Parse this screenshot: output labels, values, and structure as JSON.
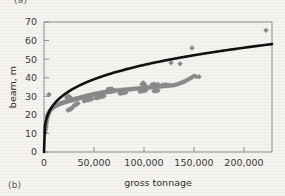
{
  "figure": {
    "panel_a_label": "(a)",
    "panel_b_label": "(b)"
  },
  "chart_data": {
    "type": "scatter",
    "title": "",
    "xlabel": "gross tonnage",
    "ylabel": "beam, m",
    "xlim": [
      0,
      228000
    ],
    "ylim": [
      0,
      70
    ],
    "grid": false,
    "legend": null,
    "xticks": [
      0,
      50000,
      100000,
      150000,
      200000
    ],
    "xticklabels": [
      "0",
      "50,000",
      "100,000",
      "150,000",
      "200,000"
    ],
    "yticks": [
      0,
      10,
      20,
      30,
      40,
      50,
      60,
      70
    ],
    "yticklabels": [
      "0",
      "10",
      "20",
      "30",
      "40",
      "50",
      "60",
      "70"
    ],
    "marker_shape": "diamond",
    "marker_color": "#8a8a8a",
    "curve_color": "#111111",
    "curve_label": "power-law fit",
    "curve_formula": "beam = 2.35 * tonnage^0.26",
    "points": [
      [
        1200,
        10.5
      ],
      [
        1500,
        12.0
      ],
      [
        1700,
        13.2
      ],
      [
        1900,
        14.0
      ],
      [
        2100,
        15.1
      ],
      [
        2300,
        16.0
      ],
      [
        2600,
        17.0
      ],
      [
        2900,
        17.8
      ],
      [
        3200,
        18.6
      ],
      [
        3600,
        19.2
      ],
      [
        4000,
        19.9
      ],
      [
        4400,
        20.4
      ],
      [
        4800,
        21.0
      ],
      [
        5200,
        21.5
      ],
      [
        5600,
        22.0
      ],
      [
        5000,
        31.0
      ],
      [
        6200,
        22.4
      ],
      [
        6800,
        22.8
      ],
      [
        7400,
        23.1
      ],
      [
        8000,
        23.5
      ],
      [
        8600,
        23.8
      ],
      [
        9200,
        24.0
      ],
      [
        9900,
        24.3
      ],
      [
        10600,
        24.6
      ],
      [
        11300,
        24.8
      ],
      [
        12000,
        25.0
      ],
      [
        12800,
        25.2
      ],
      [
        13600,
        25.4
      ],
      [
        14400,
        25.6
      ],
      [
        15200,
        25.8
      ],
      [
        16000,
        26.0
      ],
      [
        17000,
        26.2
      ],
      [
        18000,
        26.4
      ],
      [
        19000,
        26.5
      ],
      [
        20000,
        26.7
      ],
      [
        21000,
        26.9
      ],
      [
        22000,
        27.0
      ],
      [
        23000,
        27.2
      ],
      [
        24000,
        27.4
      ],
      [
        25000,
        27.6
      ],
      [
        26000,
        27.7
      ],
      [
        22500,
        29.5
      ],
      [
        23500,
        29.8
      ],
      [
        24500,
        30.0
      ],
      [
        25500,
        29.6
      ],
      [
        26500,
        29.2
      ],
      [
        24000,
        22.5
      ],
      [
        25000,
        22.8
      ],
      [
        26000,
        23.0
      ],
      [
        27000,
        23.3
      ],
      [
        28000,
        23.6
      ],
      [
        27500,
        27.9
      ],
      [
        28500,
        28.0
      ],
      [
        29500,
        28.2
      ],
      [
        30500,
        28.4
      ],
      [
        31500,
        28.5
      ],
      [
        32500,
        28.7
      ],
      [
        33500,
        28.8
      ],
      [
        34500,
        29.0
      ],
      [
        35500,
        29.1
      ],
      [
        36500,
        29.3
      ],
      [
        30000,
        25.0
      ],
      [
        31000,
        25.3
      ],
      [
        32000,
        25.6
      ],
      [
        33000,
        25.9
      ],
      [
        34000,
        26.2
      ],
      [
        37500,
        29.4
      ],
      [
        38500,
        29.6
      ],
      [
        39500,
        29.7
      ],
      [
        40500,
        29.8
      ],
      [
        41500,
        30.0
      ],
      [
        42500,
        30.1
      ],
      [
        43500,
        30.2
      ],
      [
        44500,
        30.4
      ],
      [
        45500,
        30.5
      ],
      [
        46500,
        30.6
      ],
      [
        40000,
        27.5
      ],
      [
        42000,
        27.8
      ],
      [
        44000,
        28.0
      ],
      [
        46000,
        28.3
      ],
      [
        48000,
        28.6
      ],
      [
        47500,
        30.7
      ],
      [
        48500,
        30.8
      ],
      [
        49500,
        31.0
      ],
      [
        50500,
        31.1
      ],
      [
        51500,
        31.2
      ],
      [
        52500,
        31.3
      ],
      [
        53500,
        31.4
      ],
      [
        54500,
        31.5
      ],
      [
        55500,
        31.6
      ],
      [
        56500,
        31.7
      ],
      [
        52000,
        29.0
      ],
      [
        54000,
        29.3
      ],
      [
        56000,
        29.6
      ],
      [
        58000,
        29.8
      ],
      [
        60000,
        30.1
      ],
      [
        57500,
        31.8
      ],
      [
        58500,
        31.9
      ],
      [
        59500,
        32.0
      ],
      [
        60500,
        32.1
      ],
      [
        61500,
        32.2
      ],
      [
        62500,
        32.3
      ],
      [
        63500,
        32.4
      ],
      [
        64500,
        32.5
      ],
      [
        65500,
        32.5
      ],
      [
        66500,
        32.6
      ],
      [
        64000,
        33.8
      ],
      [
        66000,
        33.9
      ],
      [
        68000,
        34.0
      ],
      [
        67500,
        32.7
      ],
      [
        68500,
        32.8
      ],
      [
        69500,
        32.9
      ],
      [
        70500,
        33.0
      ],
      [
        72000,
        33.1
      ],
      [
        74000,
        33.2
      ],
      [
        76000,
        33.3
      ],
      [
        78000,
        33.4
      ],
      [
        80000,
        33.5
      ],
      [
        82000,
        33.6
      ],
      [
        76000,
        31.5
      ],
      [
        78000,
        31.7
      ],
      [
        80000,
        31.9
      ],
      [
        82000,
        32.1
      ],
      [
        84000,
        33.7
      ],
      [
        86000,
        33.8
      ],
      [
        88000,
        33.9
      ],
      [
        90000,
        34.0
      ],
      [
        92000,
        34.1
      ],
      [
        94000,
        34.2
      ],
      [
        96000,
        34.3
      ],
      [
        98000,
        34.4
      ],
      [
        100000,
        34.5
      ],
      [
        102000,
        34.6
      ],
      [
        96000,
        32.6
      ],
      [
        98000,
        32.8
      ],
      [
        100000,
        33.0
      ],
      [
        102000,
        33.2
      ],
      [
        98000,
        36.5
      ],
      [
        99000,
        37.2
      ],
      [
        100000,
        36.8
      ],
      [
        101000,
        36.0
      ],
      [
        104000,
        34.7
      ],
      [
        106000,
        34.8
      ],
      [
        108000,
        34.9
      ],
      [
        110000,
        35.0
      ],
      [
        112000,
        35.1
      ],
      [
        108000,
        36.3
      ],
      [
        110000,
        36.5
      ],
      [
        112000,
        36.2
      ],
      [
        114000,
        36.4
      ],
      [
        110000,
        32.8
      ],
      [
        112000,
        33.0
      ],
      [
        114000,
        33.1
      ],
      [
        114000,
        35.2
      ],
      [
        116000,
        35.3
      ],
      [
        118000,
        35.4
      ],
      [
        120000,
        35.5
      ],
      [
        122000,
        35.6
      ],
      [
        118000,
        36.0
      ],
      [
        120000,
        36.1
      ],
      [
        122000,
        36.2
      ],
      [
        124000,
        36.0
      ],
      [
        124000,
        35.7
      ],
      [
        126000,
        35.8
      ],
      [
        128000,
        35.9
      ],
      [
        130000,
        36.0
      ],
      [
        127000,
        48.0
      ],
      [
        132000,
        36.3
      ],
      [
        134000,
        36.6
      ],
      [
        136000,
        37.0
      ],
      [
        138000,
        37.4
      ],
      [
        140000,
        37.8
      ],
      [
        136000,
        47.5
      ],
      [
        142000,
        38.4
      ],
      [
        144000,
        39.0
      ],
      [
        146000,
        39.6
      ],
      [
        148000,
        40.2
      ],
      [
        150000,
        41.0
      ],
      [
        148000,
        56.0
      ],
      [
        152000,
        40.6
      ],
      [
        155000,
        40.5
      ],
      [
        222000,
        65.5
      ]
    ],
    "outliers": [
      {
        "x": 5000,
        "y": 31.0,
        "note": "low-tonnage high-beam point"
      },
      {
        "x": 127000,
        "y": 48.0,
        "note": "above trend"
      },
      {
        "x": 136000,
        "y": 47.5,
        "note": "above trend"
      },
      {
        "x": 148000,
        "y": 56.0,
        "note": "above trend"
      },
      {
        "x": 222000,
        "y": 65.5,
        "note": "extreme high-tonnage high-beam point"
      }
    ]
  }
}
